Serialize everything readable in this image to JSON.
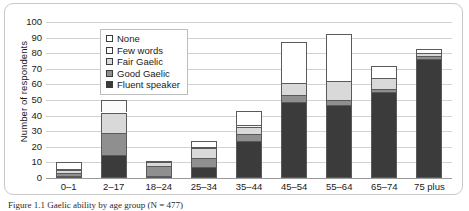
{
  "figure": {
    "caption": "Figure 1.1 Gaelic ability by age group (N = 477)"
  },
  "chart_data": {
    "type": "bar",
    "stacked": true,
    "title": "",
    "xlabel": "",
    "ylabel": "Number of respondents",
    "ylim": [
      0,
      100
    ],
    "ytick_step": 10,
    "yticks": [
      100,
      90,
      80,
      70,
      60,
      50,
      40,
      30,
      20,
      10,
      0
    ],
    "grid": "horizontal",
    "legend_position": "upper-left-inside",
    "categories": [
      "0–1",
      "2–17",
      "18–24",
      "25–34",
      "35–44",
      "45–54",
      "55–64",
      "65–74",
      "75 plus"
    ],
    "series": [
      {
        "name": "Fluent speaker",
        "color": "#3b3b3b",
        "values": [
          1,
          15,
          1,
          7,
          24,
          49,
          47,
          55,
          76
        ]
      },
      {
        "name": "Good Gaelic",
        "color": "#8f8f8f",
        "values": [
          2,
          14,
          7,
          6,
          4,
          4,
          3,
          2,
          2
        ]
      },
      {
        "name": "Fair Gaelic",
        "color": "#d9d9d9",
        "values": [
          2,
          13,
          2,
          6,
          5,
          8,
          12,
          7,
          2
        ]
      },
      {
        "name": "Few words",
        "color": "#fbfbfb",
        "values": [
          1,
          8,
          0,
          1,
          1,
          0,
          0,
          0,
          0
        ]
      },
      {
        "name": "None",
        "color": "#ffffff",
        "values": [
          4,
          0,
          1,
          4,
          9,
          26,
          30,
          8,
          3
        ]
      }
    ],
    "totals": [
      10,
      50,
      11,
      24,
      43,
      87,
      92,
      72,
      83
    ]
  }
}
